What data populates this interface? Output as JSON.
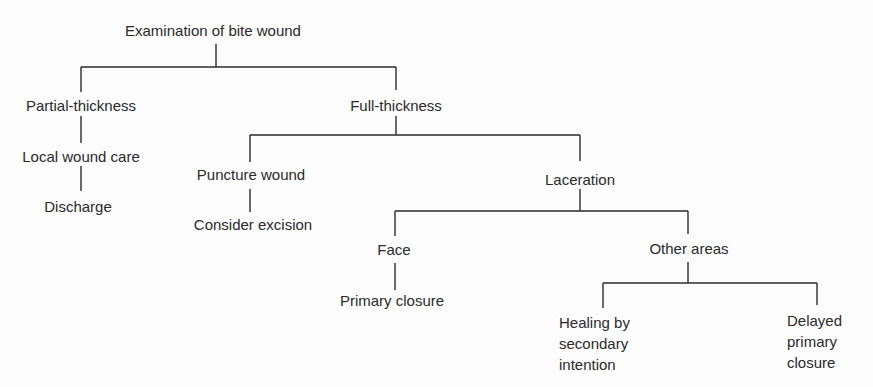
{
  "diagram": {
    "title": "Examination of bite wound",
    "line_color": "#2a2a2a",
    "nodes": {
      "root": "Examination of bite wound",
      "partial": "Partial-thickness",
      "local_care": "Local wound care",
      "discharge": "Discharge",
      "full": "Full-thickness",
      "puncture": "Puncture wound",
      "excision": "Consider excision",
      "laceration": "Laceration",
      "face": "Face",
      "primary_closure": "Primary closure",
      "other_areas": "Other areas",
      "healing_l1": "Healing by",
      "healing_l2": "secondary",
      "healing_l3": "intention",
      "delayed_l1": "Delayed",
      "delayed_l2": "primary",
      "delayed_l3": "closure"
    },
    "edges": [
      [
        "Examination of bite wound",
        "Partial-thickness"
      ],
      [
        "Examination of bite wound",
        "Full-thickness"
      ],
      [
        "Partial-thickness",
        "Local wound care"
      ],
      [
        "Local wound care",
        "Discharge"
      ],
      [
        "Full-thickness",
        "Puncture wound"
      ],
      [
        "Full-thickness",
        "Laceration"
      ],
      [
        "Puncture wound",
        "Consider excision"
      ],
      [
        "Laceration",
        "Face"
      ],
      [
        "Laceration",
        "Other areas"
      ],
      [
        "Face",
        "Primary closure"
      ],
      [
        "Other areas",
        "Healing by secondary intention"
      ],
      [
        "Other areas",
        "Delayed primary closure"
      ]
    ]
  }
}
